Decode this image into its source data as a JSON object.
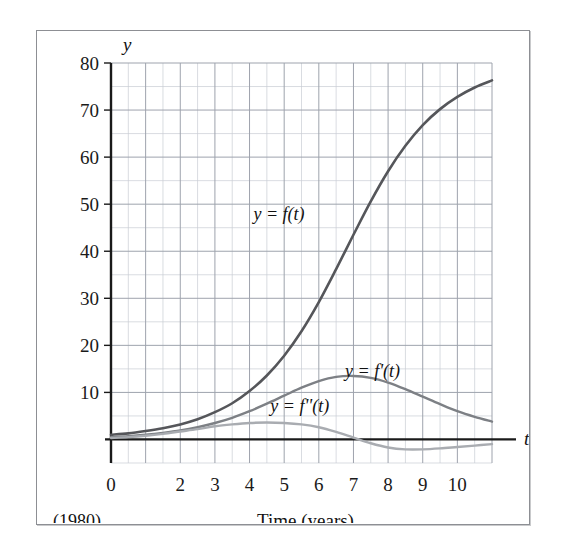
{
  "figure": {
    "y_axis_name": "y",
    "t_axis_name": "t",
    "x_axis_title": "Time (years)",
    "origin_note": "(1980)",
    "frame_color": "#8d8f94",
    "grid_major_color": "#9ea3ad",
    "grid_minor_color": "#c9cdd4",
    "axis_color": "#1a1a1a"
  },
  "chart_data": {
    "type": "line",
    "title": "",
    "subtitle": "",
    "xlabel": "Time (years)",
    "ylabel": "y",
    "xlim": [
      0,
      11
    ],
    "ylim": [
      -5,
      80
    ],
    "grid": true,
    "grid_major_x_step": 1,
    "grid_major_y_step": 10,
    "grid_minor_x_step": 0.5,
    "grid_minor_y_step": 5,
    "legend_position": "inline-annotations",
    "x_tick_labels": [
      "0",
      "",
      "2",
      "3",
      "4",
      "5",
      "6",
      "7",
      "8",
      "9",
      "10"
    ],
    "x_ticks": [
      0,
      1,
      2,
      3,
      4,
      5,
      6,
      7,
      8,
      9,
      10
    ],
    "y_ticks": [
      10,
      20,
      30,
      40,
      50,
      60,
      70,
      80
    ],
    "y_tick_labels": [
      "10",
      "20",
      "30",
      "40",
      "50",
      "60",
      "70",
      "80"
    ],
    "annotations": [
      {
        "text": "(1980)",
        "x": 0,
        "y": -9,
        "note": "origin year marker below axis"
      }
    ],
    "series": [
      {
        "name": "y = f(t)",
        "color": "#55565a",
        "width": 2.6,
        "label_x": 4.85,
        "label_y": 48,
        "x": [
          0,
          0.5,
          1,
          1.5,
          2,
          2.5,
          3,
          3.5,
          4,
          4.5,
          5,
          5.5,
          6,
          6.5,
          7,
          7.5,
          8,
          8.5,
          9,
          9.5,
          10,
          10.5,
          11
        ],
        "values": [
          1.0,
          1.3,
          1.8,
          2.4,
          3.2,
          4.3,
          5.8,
          7.7,
          10.3,
          13.6,
          17.8,
          23.0,
          29.2,
          36.2,
          43.5,
          50.6,
          57.0,
          62.4,
          66.8,
          70.2,
          72.8,
          74.8,
          76.3
        ]
      },
      {
        "name": "y = f'(t)",
        "color": "#7d8085",
        "width": 2.4,
        "label_x": 7.55,
        "label_y": 14.5,
        "x": [
          0,
          0.5,
          1,
          1.5,
          2,
          2.5,
          3,
          3.5,
          4,
          4.5,
          5,
          5.5,
          6,
          6.5,
          7,
          7.5,
          8,
          8.5,
          9,
          9.5,
          10,
          10.5,
          11
        ],
        "values": [
          0.5,
          0.7,
          1.0,
          1.4,
          1.9,
          2.6,
          3.5,
          4.6,
          6.0,
          7.6,
          9.3,
          11.0,
          12.4,
          13.3,
          13.5,
          13.1,
          12.1,
          10.7,
          9.1,
          7.5,
          6.0,
          4.8,
          3.8
        ]
      },
      {
        "name": "y = f''(t)",
        "color": "#a9acb1",
        "width": 2.4,
        "label_x": 5.45,
        "label_y": 7.2,
        "x": [
          0,
          0.5,
          1,
          1.5,
          2,
          2.5,
          3,
          3.5,
          4,
          4.5,
          5,
          5.5,
          6,
          6.5,
          7,
          7.5,
          8,
          8.5,
          9,
          9.5,
          10,
          10.5,
          11
        ],
        "values": [
          0.3,
          0.5,
          0.8,
          1.2,
          1.7,
          2.2,
          2.8,
          3.2,
          3.5,
          3.6,
          3.5,
          3.2,
          2.6,
          1.6,
          0.4,
          -0.8,
          -1.7,
          -2.1,
          -2.1,
          -1.9,
          -1.6,
          -1.3,
          -1.0
        ]
      }
    ]
  }
}
